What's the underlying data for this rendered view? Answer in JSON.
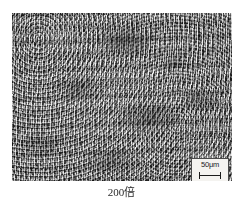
{
  "figure": {
    "type": "micrograph",
    "caption": "200倍",
    "magnification": "200",
    "modality": "optical-metallography",
    "color_mode": "grayscale"
  },
  "scale_bar": {
    "label": "50μm",
    "value": "50",
    "unit": "μm",
    "box_background": "#f4f3f0",
    "box_border_color": "#4a4a4a",
    "tick_color": "#1b1b1b"
  },
  "colors": {
    "page_background": "#ffffff",
    "micrograph_base": "#8d8d8d",
    "caption_text": "#2a2a2a"
  }
}
